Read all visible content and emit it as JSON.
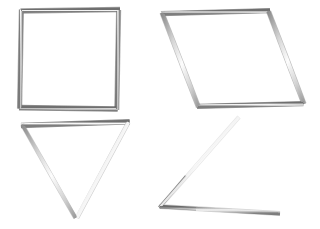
{
  "scene": {
    "title": "Four geometric figures formed from thin metallic rods",
    "background_color": "#ffffff",
    "width": 320,
    "height": 229,
    "rod_color": "#9a9a9a",
    "rod_highlight_color": "#f2f2f2",
    "rod_shadow_color": "#5d5d5d",
    "rod_thickness_px": 4
  },
  "objects": [
    {
      "id": "square",
      "name": "square-frame",
      "label": "Square",
      "closed": true,
      "sides": 4,
      "position": "top-left",
      "vertices": [
        [
          22,
          11
        ],
        [
          119,
          10
        ],
        [
          117,
          110
        ],
        [
          20,
          108
        ]
      ]
    },
    {
      "id": "parallelogram",
      "name": "parallelogram-frame",
      "label": "Parallelogram",
      "closed": true,
      "sides": 4,
      "position": "top-right",
      "vertices": [
        [
          162,
          13
        ],
        [
          268,
          11
        ],
        [
          303,
          103
        ],
        [
          198,
          106
        ]
      ]
    },
    {
      "id": "triangle",
      "name": "triangle-frame",
      "label": "Inverted triangle",
      "closed": true,
      "sides": 3,
      "position": "bottom-left",
      "vertices": [
        [
          22,
          125
        ],
        [
          128,
          122
        ],
        [
          76,
          217
        ]
      ]
    },
    {
      "id": "open-angle",
      "name": "open-angle-rods",
      "label": "Open angle of two rods",
      "closed": false,
      "sides": 2,
      "position": "bottom-right",
      "vertices": [
        [
          238,
          118
        ],
        [
          160,
          207
        ],
        [
          278,
          213
        ]
      ]
    }
  ]
}
